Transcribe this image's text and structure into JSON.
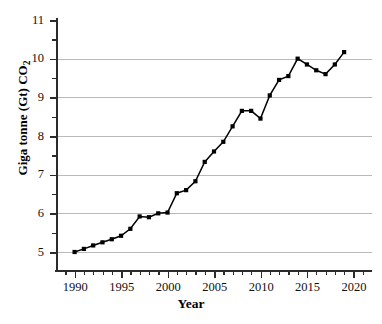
{
  "chart_data": {
    "type": "line",
    "title": "",
    "xlabel": "Year",
    "ylabel": "Giga tonne (Gt) CO2",
    "ylabel_display": "Giga tonne (Gt) CO",
    "ylabel_subscript": "2",
    "xlim": [
      1988,
      2022
    ],
    "ylim": [
      5,
      11
    ],
    "grid": true,
    "legend": "none",
    "marker": "square",
    "line_color": "#000000",
    "grid_color": "#b9b9b9",
    "axis_color": "#2b2b2b",
    "background_color": "#ffffff",
    "x_major_ticks": [
      1990,
      1995,
      2000,
      2005,
      2010,
      2015,
      2020
    ],
    "x_tick_labels": [
      "1990",
      "1995",
      "2000",
      "2005",
      "2010",
      "2015",
      "2020"
    ],
    "x_minor_tick_step": 1,
    "y_major_ticks": [
      5,
      6,
      7,
      8,
      9,
      10,
      11
    ],
    "y_tick_labels": [
      "5",
      "6",
      "7",
      "8",
      "9",
      "10",
      "11"
    ],
    "y_minor_ticks": [
      5.5,
      6.5,
      7.5,
      8.5,
      9.5,
      10.5
    ],
    "x": [
      1990,
      1991,
      1992,
      1993,
      1994,
      1995,
      1996,
      1997,
      1998,
      1999,
      2000,
      2001,
      2002,
      2003,
      2004,
      2005,
      2006,
      2007,
      2008,
      2009,
      2010,
      2011,
      2012,
      2013,
      2014,
      2015,
      2016,
      2017,
      2018
    ],
    "values": [
      5.0,
      5.1,
      5.18,
      5.25,
      5.33,
      5.42,
      5.6,
      5.92,
      5.92,
      6.0,
      6.02,
      6.0,
      6.52,
      6.6,
      6.83,
      7.33,
      7.6,
      7.85,
      8.25,
      8.65,
      8.65,
      8.45,
      9.05,
      9.45,
      9.55,
      10.0,
      9.85,
      9.7,
      9.6
    ],
    "series": [
      {
        "name": "Global CO2 emissions",
        "points": [
          {
            "x": 1990,
            "y": 5.0
          },
          {
            "x": 1991,
            "y": 5.08
          },
          {
            "x": 1992,
            "y": 5.17
          },
          {
            "x": 1993,
            "y": 5.25
          },
          {
            "x": 1994,
            "y": 5.33
          },
          {
            "x": 1995,
            "y": 5.42
          },
          {
            "x": 1996,
            "y": 5.6
          },
          {
            "x": 1997,
            "y": 5.92
          },
          {
            "x": 1998,
            "y": 5.9
          },
          {
            "x": 1999,
            "y": 6.0
          },
          {
            "x": 2000,
            "y": 6.02
          },
          {
            "x": 2001,
            "y": 6.52
          },
          {
            "x": 2002,
            "y": 6.6
          },
          {
            "x": 2003,
            "y": 6.83
          },
          {
            "x": 2004,
            "y": 7.33
          },
          {
            "x": 2005,
            "y": 7.6
          },
          {
            "x": 2006,
            "y": 7.85
          },
          {
            "x": 2007,
            "y": 8.25
          },
          {
            "x": 2008,
            "y": 8.65
          },
          {
            "x": 2009,
            "y": 8.65
          },
          {
            "x": 2010,
            "y": 8.45
          },
          {
            "x": 2011,
            "y": 9.05
          },
          {
            "x": 2012,
            "y": 9.45
          },
          {
            "x": 2013,
            "y": 9.55
          },
          {
            "x": 2014,
            "y": 10.0
          },
          {
            "x": 2015,
            "y": 9.85
          },
          {
            "x": 2016,
            "y": 9.7
          },
          {
            "x": 2017,
            "y": 9.6
          },
          {
            "x": 2018,
            "y": 9.85
          },
          {
            "x": 2019,
            "y": 10.17
          }
        ]
      }
    ]
  }
}
